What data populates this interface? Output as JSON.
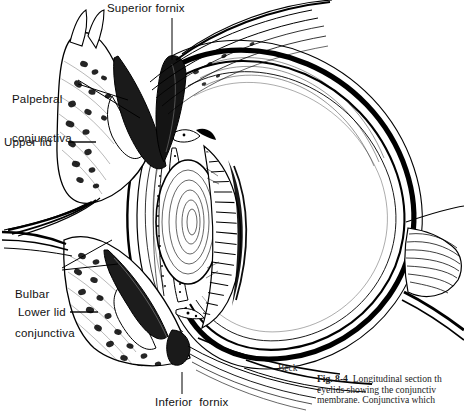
{
  "figure": {
    "artist_signature": "Beck",
    "style": "pen-and-ink line engraving, black on white",
    "ink_color": "#000000",
    "paper_color": "#ffffff"
  },
  "labels": {
    "superior_fornix": "Superior fornix",
    "palpebral_conjunctiva_line1": "Palpebral",
    "palpebral_conjunctiva_line2": "conjunctiva",
    "upper_lid": "Upper lid",
    "bulbar_conjunctiva_line1": "Bulbar",
    "bulbar_conjunctiva_line2": "conjunctiva",
    "lower_lid": "Lower lid",
    "inferior_fornix": "Inferior  fornix"
  },
  "caption": {
    "fig_number": "Fig. 8-4",
    "line1": "Longitudinal section th",
    "line2": "eyelids showing the conjunctiv",
    "line3": "membrane. Conjunctiva which",
    "note": "caption text is clipped by the right edge of the page"
  },
  "anatomy": {
    "structures": [
      "upper eyelid with tarsal plate and meibomian glands",
      "lower eyelid with tarsal plate and meibomian glands",
      "superior conjunctival fornix",
      "inferior conjunctival fornix",
      "palpebral conjunctiva",
      "bulbar conjunctiva",
      "cornea",
      "anterior chamber",
      "iris",
      "crystalline lens with concentric lamellae",
      "ciliary body with radiating zonular fibers",
      "sclera",
      "choroid",
      "retina",
      "vitreous chamber",
      "optic nerve",
      "eyelashes (cilia)",
      "levator palpebrae / orbital septum fibers"
    ]
  }
}
